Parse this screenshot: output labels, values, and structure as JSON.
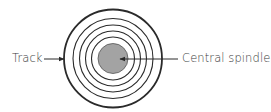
{
  "diagram": {
    "center": {
      "x": 113,
      "y": 58.5
    },
    "rings": [
      {
        "r": 49,
        "stroke_width": 1.8
      },
      {
        "r": 40,
        "stroke_width": 1.1
      },
      {
        "r": 33.5,
        "stroke_width": 1.1
      },
      {
        "r": 27.5,
        "stroke_width": 1.1
      },
      {
        "r": 21.5,
        "stroke_width": 1.1
      }
    ],
    "spindle": {
      "r": 15,
      "fill": "#a3a3a3",
      "stroke": "#555555"
    },
    "line_color": "#2a2a2a",
    "labels": {
      "track": "Track",
      "spindle": "Central spindle"
    },
    "arrows": {
      "track": {
        "x1": 44,
        "y1": 59,
        "x2": 64,
        "y2": 59
      },
      "spindle": {
        "x1": 178,
        "y1": 59,
        "x2": 120,
        "y2": 59
      }
    }
  }
}
